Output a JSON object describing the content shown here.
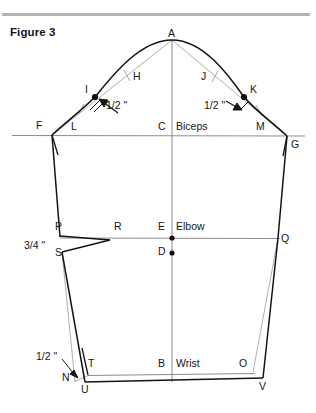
{
  "figure": {
    "title": "Figure 3",
    "kind": "sleeve-pattern-draft-diagram"
  },
  "colors": {
    "ink": "#161616",
    "thin_line": "#888888",
    "top_rule": "#b4b4b4",
    "background": "#ffffff"
  },
  "top_rule": {
    "name": "horizontal-divider"
  },
  "points": [
    {
      "id": "A",
      "label": "A",
      "x": 172,
      "y": 40,
      "label_x": 168,
      "label_y": 28,
      "dot": false
    },
    {
      "id": "I",
      "label": "I",
      "x": 95,
      "y": 97,
      "label_x": 85,
      "label_y": 84,
      "dot": true
    },
    {
      "id": "K",
      "label": "K",
      "x": 244,
      "y": 97,
      "label_x": 250,
      "label_y": 84,
      "dot": true
    },
    {
      "id": "H",
      "label": "H",
      "x": 137,
      "y": 78,
      "label_x": 133,
      "label_y": 71,
      "dot": false
    },
    {
      "id": "J",
      "label": "J",
      "x": 205,
      "y": 78,
      "label_x": 201,
      "label_y": 71,
      "dot": false
    },
    {
      "id": "F",
      "label": "F",
      "x": 52,
      "y": 135,
      "label_x": 36,
      "label_y": 120,
      "dot": false
    },
    {
      "id": "L",
      "label": "L",
      "x": 76,
      "y": 135,
      "label_x": 71,
      "label_y": 121,
      "dot": false
    },
    {
      "id": "C",
      "label": "C",
      "x": 172,
      "y": 135,
      "label_x": 158,
      "label_y": 121,
      "dot": false
    },
    {
      "id": "M",
      "label": "M",
      "x": 262,
      "y": 135,
      "label_x": 256,
      "label_y": 121,
      "dot": false
    },
    {
      "id": "G",
      "label": "G",
      "x": 287,
      "y": 136,
      "label_x": 291,
      "label_y": 139,
      "dot": false
    },
    {
      "id": "P",
      "label": "P",
      "x": 60,
      "y": 237,
      "label_x": 55,
      "label_y": 221,
      "dot": false
    },
    {
      "id": "R",
      "label": "R",
      "x": 110,
      "y": 240,
      "label_x": 114,
      "label_y": 221,
      "dot": false
    },
    {
      "id": "E",
      "label": "E",
      "x": 172,
      "y": 238,
      "label_x": 158,
      "label_y": 221,
      "dot": true
    },
    {
      "id": "D",
      "label": "D",
      "x": 172,
      "y": 253,
      "label_x": 158,
      "label_y": 246,
      "dot": true
    },
    {
      "id": "Q",
      "label": "Q",
      "x": 278,
      "y": 238,
      "label_x": 281,
      "label_y": 233,
      "dot": false
    },
    {
      "id": "S",
      "label": "S",
      "x": 62,
      "y": 252,
      "label_x": 55,
      "label_y": 247,
      "dot": false
    },
    {
      "id": "T",
      "label": "T",
      "x": 88,
      "y": 375,
      "label_x": 88,
      "label_y": 358,
      "dot": false
    },
    {
      "id": "N",
      "label": "N",
      "x": 75,
      "y": 382,
      "label_x": 62,
      "label_y": 372,
      "dot": false
    },
    {
      "id": "U",
      "label": "U",
      "x": 85,
      "y": 382,
      "label_x": 81,
      "label_y": 384,
      "dot": false
    },
    {
      "id": "B",
      "label": "B",
      "x": 172,
      "y": 378,
      "label_x": 158,
      "label_y": 358,
      "dot": false
    },
    {
      "id": "O",
      "label": "O",
      "x": 253,
      "y": 372,
      "label_x": 239,
      "label_y": 358,
      "dot": false
    },
    {
      "id": "V",
      "label": "V",
      "x": 263,
      "y": 378,
      "label_x": 259,
      "label_y": 381,
      "dot": false
    }
  ],
  "annotations": [
    {
      "id": "biceps",
      "text": "Biceps",
      "x": 176,
      "y": 121,
      "type": "line-name"
    },
    {
      "id": "elbow",
      "text": "Elbow",
      "x": 176,
      "y": 221,
      "type": "line-name"
    },
    {
      "id": "wrist",
      "text": "Wrist",
      "x": 176,
      "y": 358,
      "type": "line-name"
    }
  ],
  "measurements": [
    {
      "id": "cap-left-inset",
      "text": "1/2 \"",
      "x": 106,
      "y": 100,
      "note": "left cap hollow depth at I"
    },
    {
      "id": "cap-right-inset",
      "text": "1/2 \"",
      "x": 204,
      "y": 100,
      "note": "right cap hollow depth at K"
    },
    {
      "id": "elbow-drop",
      "text": "3/4 \"",
      "x": 24,
      "y": 240,
      "note": "elbow dart drop P to S"
    },
    {
      "id": "wrist-inset",
      "text": "1/2 \"",
      "x": 36,
      "y": 351,
      "note": "wrist seam inset at N"
    }
  ],
  "arrows": [
    {
      "id": "arrow-to-I",
      "from_x": 118,
      "from_y": 113,
      "to_x": 101,
      "to_y": 101
    },
    {
      "id": "arrow-to-K",
      "from_x": 226,
      "from_y": 104,
      "to_x": 241,
      "to_y": 104
    },
    {
      "id": "arrow-to-N",
      "from_x": 60,
      "from_y": 360,
      "to_x": 76,
      "to_y": 377
    }
  ]
}
